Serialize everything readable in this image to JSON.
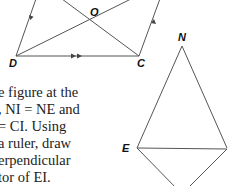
{
  "figure_parallelogram": {
    "labels": {
      "O": "O",
      "D": "D",
      "C": "C"
    },
    "vertices": {
      "D": [
        16,
        56
      ],
      "C": [
        139,
        56
      ],
      "top_left": [
        36,
        -4
      ],
      "top_right": [
        160,
        -4
      ]
    },
    "marks": {
      "parallel_single_arrows": "sides DA and CB",
      "parallel_double_arrows": "side DC"
    }
  },
  "figure_kite": {
    "labels": {
      "N": "N",
      "E": "E"
    },
    "vertices": {
      "N": [
        182,
        46
      ],
      "E": [
        137,
        148
      ],
      "I": [
        227,
        148
      ],
      "bottom": [
        182,
        192
      ]
    }
  },
  "problem": {
    "lines": [
      "e figure at the",
      ", NI = NE and",
      "= CI. Using",
      "a ruler, draw",
      "erpendicular",
      "tor of EI."
    ],
    "segment": "EI"
  }
}
